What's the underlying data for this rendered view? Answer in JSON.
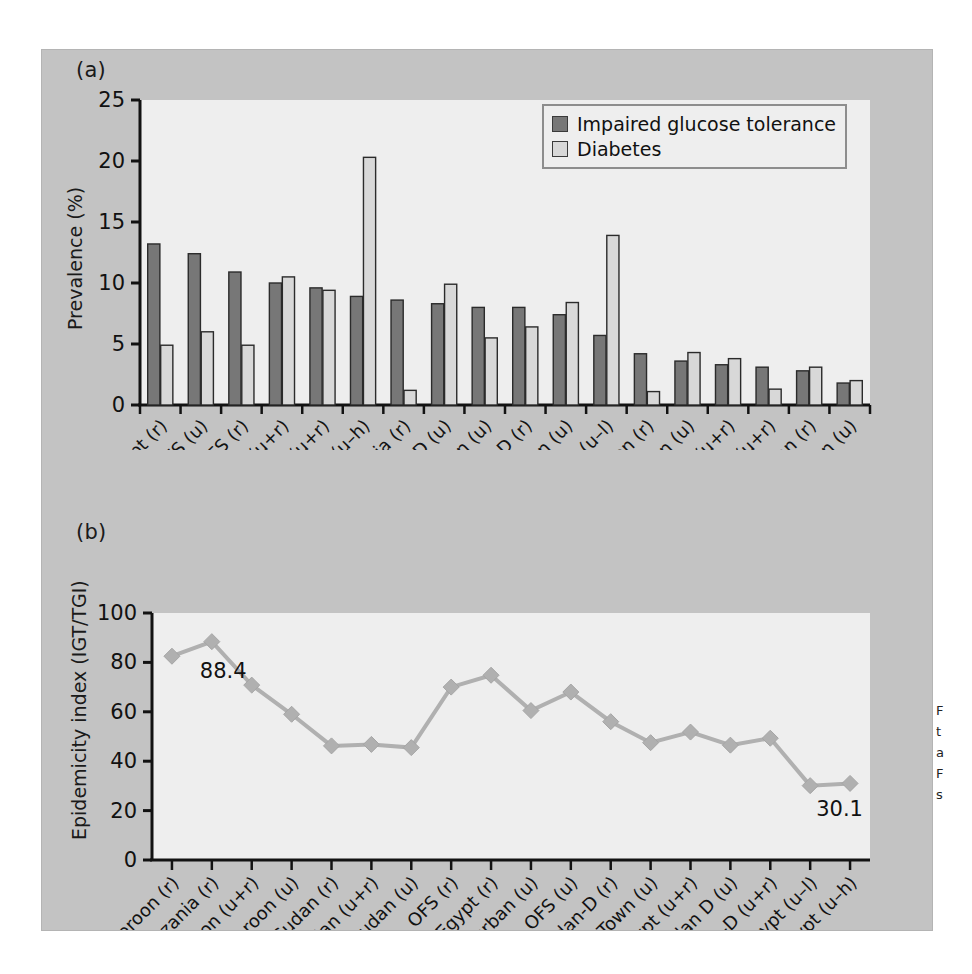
{
  "figure": {
    "panel_bg": "#c3c3c3",
    "plot_bg": "#eeeeee",
    "page_bg": "#ffffff"
  },
  "subplot_a": {
    "label": "(a)",
    "ylabel": "Prevalence (%)",
    "yticks": [
      "0",
      "5",
      "10",
      "15",
      "20",
      "25"
    ],
    "legend": {
      "items": [
        {
          "label": "Impaired glucose tolerance",
          "color": "#777777"
        },
        {
          "label": "Diabetes",
          "color": "#d8d8d8"
        }
      ]
    }
  },
  "subplot_b": {
    "label": "(b)",
    "ylabel": "Epidemicity index (IGT/TGI)",
    "yticks": [
      "0",
      "20",
      "40",
      "60",
      "80",
      "100"
    ],
    "annotations": [
      {
        "text": "88.4",
        "index": 1
      },
      {
        "text": "30.1",
        "index": 16
      }
    ],
    "series_color": "#b0b0b0"
  },
  "caption_sliver": {
    "lines": [
      "F",
      "t",
      "a",
      "F",
      "s"
    ]
  },
  "chart_data": [
    {
      "type": "bar",
      "title": "(a)",
      "xlabel": "",
      "ylabel": "Prevalence (%)",
      "ylim": [
        0,
        25
      ],
      "yticks": [
        0,
        5,
        10,
        15,
        20,
        25
      ],
      "grid": false,
      "legend_position": "top-right",
      "categories": [
        "Egypt (r)",
        "OFS (u)",
        "OFS (r)",
        "Sudan-D (u+r)",
        "Egypt (u+r)",
        "Egypt (u–h)",
        "Tanzania (r)",
        "Sudan D (u)",
        "Durban (u)",
        "Sudan-D (r)",
        "C.Town (u)",
        "Egypt (u–l)",
        "Cameroon (r)",
        "Sudan (u)",
        "Sudan (u+r)",
        "Cameroon (u+r)",
        "Sudan (r)",
        "Cameroon (u)"
      ],
      "series": [
        {
          "name": "Impaired glucose tolerance",
          "color": "#777777",
          "values": [
            13.2,
            12.4,
            10.9,
            10.0,
            9.6,
            8.9,
            8.6,
            8.3,
            8.0,
            8.0,
            7.4,
            5.7,
            4.2,
            3.6,
            3.3,
            3.1,
            2.8,
            1.8
          ]
        },
        {
          "name": "Diabetes",
          "color": "#d8d8d8",
          "values": [
            4.9,
            6.0,
            4.9,
            10.5,
            9.4,
            20.3,
            1.2,
            9.9,
            5.5,
            6.4,
            8.4,
            13.9,
            1.1,
            4.3,
            3.8,
            1.3,
            3.1,
            2.0
          ]
        }
      ]
    },
    {
      "type": "line",
      "title": "(b)",
      "xlabel": "",
      "ylabel": "Epidemicity index (IGT/TGI)",
      "ylim": [
        0,
        100
      ],
      "yticks": [
        0,
        20,
        40,
        60,
        80,
        100
      ],
      "grid": false,
      "marker": "diamond",
      "categories": [
        "Cameroon (r)",
        "Tanzania (r)",
        "Cameroon (u+r)",
        "Cameroon (u)",
        "Sudan (r)",
        "Sudan (u+r)",
        "Sudan (u)",
        "OFS (r)",
        "Egypt (r)",
        "Durban (u)",
        "OFS (u)",
        "Sudan-D (r)",
        "C.Town (u)",
        "Egypt (u+r)",
        "Sudan D (u)",
        "Sudan-D (u+r)",
        "Egypt (u–l)",
        "Egypt (u–h)"
      ],
      "series": [
        {
          "name": "Epidemicity index",
          "color": "#b0b0b0",
          "values": [
            82.5,
            88.4,
            70.8,
            59.0,
            46.2,
            46.8,
            45.5,
            70.0,
            74.8,
            60.5,
            68.0,
            56.0,
            47.5,
            51.8,
            46.5,
            49.3,
            30.1,
            31.0
          ]
        }
      ],
      "data_labels": [
        {
          "category": "Tanzania (r)",
          "value": "88.4"
        },
        {
          "category": "Egypt (u–l)",
          "value": "30.1"
        }
      ]
    }
  ]
}
